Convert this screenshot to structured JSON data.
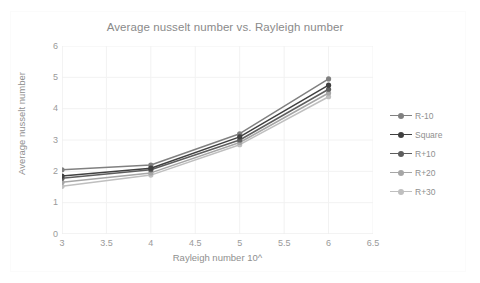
{
  "chart_data": {
    "type": "line",
    "title": "Average nusselt number vs. Rayleigh number",
    "xlabel": "Rayleigh number 10^",
    "ylabel": "Average nusselt number",
    "x": [
      3,
      4,
      5,
      6
    ],
    "xlim": [
      3,
      6.5
    ],
    "ylim": [
      0,
      6
    ],
    "xticks": [
      "3",
      "3.5",
      "4",
      "4.5",
      "5",
      "5.5",
      "6",
      "6.5"
    ],
    "xtick_values": [
      3,
      3.5,
      4,
      4.5,
      5,
      5.5,
      6,
      6.5
    ],
    "yticks": [
      "0",
      "1",
      "2",
      "3",
      "4",
      "5",
      "6"
    ],
    "ytick_values": [
      0,
      1,
      2,
      3,
      4,
      5,
      6
    ],
    "grid": true,
    "legend_position": "right",
    "series": [
      {
        "name": "R-10",
        "values": [
          2.05,
          2.2,
          3.2,
          4.95
        ],
        "color": "#808080",
        "marker": "circle"
      },
      {
        "name": "Square",
        "values": [
          1.85,
          2.1,
          3.1,
          4.75
        ],
        "color": "#404040",
        "marker": "circle"
      },
      {
        "name": "R+10",
        "values": [
          1.78,
          2.05,
          3.0,
          4.62
        ],
        "color": "#5e5e5e",
        "marker": "circle"
      },
      {
        "name": "R+20",
        "values": [
          1.65,
          1.95,
          2.92,
          4.5
        ],
        "color": "#a6a6a6",
        "marker": "circle"
      },
      {
        "name": "R+30",
        "values": [
          1.52,
          1.88,
          2.85,
          4.38
        ],
        "color": "#bfbfbf",
        "marker": "circle"
      }
    ]
  },
  "legend": {
    "items": [
      {
        "label": "R-10"
      },
      {
        "label": "Square"
      },
      {
        "label": "R+10"
      },
      {
        "label": "R+20"
      },
      {
        "label": "R+30"
      }
    ]
  },
  "colors": {
    "title": "#8a8a8a",
    "tick": "#9a9a9a",
    "axis_label": "#8f8f8f",
    "gridline": "#f2f2f2",
    "plot_background": "#ffffff",
    "frame_border": "#fbfbfb"
  }
}
